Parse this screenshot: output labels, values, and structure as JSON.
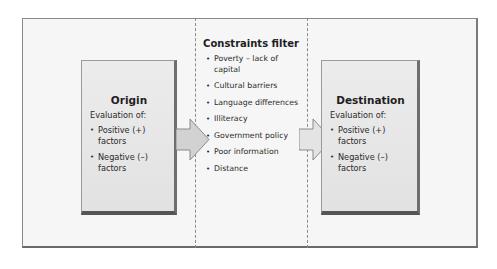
{
  "diagram": {
    "origin": {
      "title": "Origin",
      "subtitle": "Evaluation of:",
      "items": [
        "Positive (+) factors",
        "Negative (–) factors"
      ]
    },
    "constraints": {
      "title": "Constraints filter",
      "items": [
        "Poverty – lack of capital",
        "Cultural barriers",
        "Language differences",
        "Illiteracy",
        "Government policy",
        "Poor information",
        "Distance"
      ]
    },
    "destination": {
      "title": "Destination",
      "subtitle": "Evaluation of:",
      "items": [
        "Positive (+) factors",
        "Negative (–) factors"
      ]
    },
    "colors": {
      "frame_bg": "#f6f6f6",
      "box_bg": "#e6e6e6",
      "arrow_fill": "#d2d2d2",
      "border": "#6e6e6e"
    }
  }
}
